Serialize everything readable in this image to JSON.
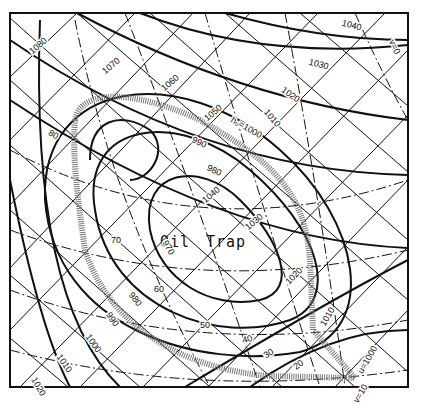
{
  "diagram": {
    "title_label": "Oil Trap",
    "title_words": [
      "Oil",
      "Trap"
    ],
    "frame": {
      "x": 10,
      "y": 13,
      "width": 398,
      "height": 374
    },
    "h_contours": {
      "style": "solid thick curved",
      "labels": [
        "1080",
        "1070",
        "1060",
        "1050",
        "1040",
        "1030",
        "1020",
        "1010",
        "1000",
        "990",
        "980",
        "970"
      ]
    },
    "dashdot_contours": {
      "style": "dash-dot",
      "labels": [
        "80",
        "70",
        "60",
        "50",
        "40",
        "30",
        "20",
        "1040",
        "1030",
        "1020",
        "1010",
        "1000",
        "990",
        "980"
      ]
    },
    "special_labels": {
      "h0": "h₀=1000",
      "u": "u=1000",
      "v0": "v=0",
      "v10": "v=10"
    },
    "label_positions": [
      {
        "text": "1080",
        "x": 40,
        "y": 48,
        "rot": -40
      },
      {
        "text": "1070",
        "x": 113,
        "y": 68,
        "rot": -40
      },
      {
        "text": "1060",
        "x": 172,
        "y": 85,
        "rot": -40
      },
      {
        "text": "1050",
        "x": 215,
        "y": 115,
        "rot": -40
      },
      {
        "text": "h₀=1000",
        "x": 245,
        "y": 130,
        "rot": 30
      },
      {
        "text": "1040",
        "x": 351,
        "y": 28,
        "rot": 15
      },
      {
        "text": "1030",
        "x": 318,
        "y": 67,
        "rot": 15
      },
      {
        "text": "1020",
        "x": 289,
        "y": 97,
        "rot": 35
      },
      {
        "text": "1010",
        "x": 270,
        "y": 120,
        "rot": 50
      },
      {
        "text": "990",
        "x": 198,
        "y": 145,
        "rot": 25
      },
      {
        "text": "980",
        "x": 213,
        "y": 173,
        "rot": 25
      },
      {
        "text": "1040",
        "x": 213,
        "y": 197,
        "rot": -40
      },
      {
        "text": "1030",
        "x": 256,
        "y": 224,
        "rot": -40
      },
      {
        "text": "80",
        "x": 52,
        "y": 137,
        "rot": 30
      },
      {
        "text": "70",
        "x": 116,
        "y": 243,
        "rot": 0
      },
      {
        "text": "970",
        "x": 166,
        "y": 249,
        "rot": 60
      },
      {
        "text": "60",
        "x": 159,
        "y": 292,
        "rot": 0
      },
      {
        "text": "980",
        "x": 133,
        "y": 301,
        "rot": 50
      },
      {
        "text": "990",
        "x": 110,
        "y": 321,
        "rot": 55
      },
      {
        "text": "1000",
        "x": 91,
        "y": 345,
        "rot": 55
      },
      {
        "text": "1010",
        "x": 62,
        "y": 365,
        "rot": 55
      },
      {
        "text": "1020",
        "x": 36,
        "y": 388,
        "rot": 60
      },
      {
        "text": "1020",
        "x": 296,
        "y": 278,
        "rot": -45
      },
      {
        "text": "50",
        "x": 205,
        "y": 328,
        "rot": 0
      },
      {
        "text": "40",
        "x": 248,
        "y": 342,
        "rot": -15
      },
      {
        "text": "30",
        "x": 270,
        "y": 356,
        "rot": -30
      },
      {
        "text": "1010",
        "x": 330,
        "y": 318,
        "rot": -60
      },
      {
        "text": "20",
        "x": 300,
        "y": 367,
        "rot": -35
      },
      {
        "text": "u=1000",
        "x": 370,
        "y": 361,
        "rot": -60
      },
      {
        "text": "v=10",
        "x": 363,
        "y": 395,
        "rot": -60
      },
      {
        "text": "v=0",
        "x": 392,
        "y": 48,
        "rot": 65
      }
    ]
  }
}
